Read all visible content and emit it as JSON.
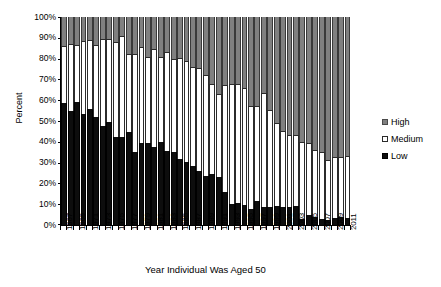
{
  "chart_data": {
    "type": "bar",
    "subtype": "stacked-100-percent-column",
    "title": "",
    "xlabel": "Year Individual Was Aged 50",
    "ylabel": "Percent",
    "ylim": [
      0,
      100
    ],
    "ytick_labels": [
      "100%",
      "90%",
      "80%",
      "70%",
      "60%",
      "50%",
      "40%",
      "30%",
      "20%",
      "10%",
      "0%"
    ],
    "ytick_values": [
      100,
      90,
      80,
      70,
      60,
      50,
      40,
      30,
      20,
      10,
      0
    ],
    "grid": false,
    "legend_position": "right",
    "stack_order_bottom_to_top": [
      "Low",
      "Medium",
      "High"
    ],
    "categories": [
      "1967",
      "1968",
      "1969",
      "1970",
      "1971",
      "1972",
      "1973",
      "1974",
      "1975",
      "1976",
      "1977",
      "1978",
      "1979",
      "1980",
      "1981",
      "1982",
      "1983",
      "1984",
      "1985",
      "1986",
      "1987",
      "1988",
      "1989",
      "1990",
      "1991",
      "1992",
      "1993",
      "1994",
      "1995",
      "1996",
      "1997",
      "1998",
      "1999",
      "2000",
      "2001",
      "2002",
      "2003",
      "2004",
      "2005",
      "2006",
      "2007",
      "2008",
      "2009",
      "2010",
      "2011"
    ],
    "xtick_labels_shown": [
      "1967",
      "1969",
      "1971",
      "1973",
      "1975",
      "1977",
      "1979",
      "1981",
      "1983",
      "1985",
      "1987",
      "1989",
      "1991",
      "1993",
      "1995",
      "1997",
      "1999",
      "2001",
      "2003",
      "2005",
      "2007",
      "2009",
      "2011"
    ],
    "series": [
      {
        "name": "Low",
        "color": "#0d0d0d",
        "values": [
          58.5,
          55.0,
          59.0,
          53.5,
          56.0,
          52.0,
          47.5,
          49.5,
          42.5,
          42.5,
          44.5,
          35.0,
          39.5,
          39.5,
          37.5,
          40.0,
          35.5,
          35.0,
          31.5,
          30.5,
          28.5,
          26.0,
          23.5,
          24.5,
          23.0,
          16.0,
          10.0,
          10.5,
          9.5,
          7.5,
          11.5,
          8.5,
          8.5,
          9.0,
          8.5,
          8.5,
          9.0,
          3.0,
          5.0,
          4.0,
          3.0,
          2.5,
          3.5,
          4.0,
          3.5
        ]
      },
      {
        "name": "Medium",
        "color": "#ffffff",
        "values": [
          27.5,
          32.0,
          27.5,
          35.0,
          33.0,
          34.5,
          42.0,
          40.0,
          45.5,
          48.5,
          37.5,
          47.0,
          46.0,
          41.5,
          47.0,
          41.0,
          47.5,
          45.0,
          49.0,
          48.5,
          47.5,
          49.5,
          48.5,
          43.5,
          40.0,
          51.5,
          58.0,
          57.5,
          56.5,
          49.5,
          45.5,
          55.0,
          47.0,
          40.0,
          36.5,
          35.0,
          34.5,
          37.0,
          34.5,
          32.0,
          32.0,
          29.0,
          29.0,
          28.5,
          29.5
        ]
      },
      {
        "name": "High",
        "color": "#808080",
        "values": [
          14.0,
          13.0,
          13.5,
          11.5,
          11.0,
          13.5,
          10.5,
          10.5,
          12.0,
          9.0,
          18.0,
          18.0,
          14.5,
          19.0,
          15.5,
          19.0,
          17.0,
          20.0,
          19.5,
          21.0,
          24.0,
          24.5,
          28.0,
          32.0,
          37.0,
          32.5,
          32.0,
          32.0,
          34.0,
          43.0,
          43.0,
          36.5,
          44.5,
          51.0,
          55.0,
          56.5,
          56.5,
          60.0,
          60.5,
          64.0,
          65.0,
          68.5,
          67.5,
          67.5,
          67.0
        ]
      }
    ]
  },
  "legend": {
    "items": [
      {
        "label": "High",
        "swatch": "high-swatch"
      },
      {
        "label": "Medium",
        "swatch": "medium-swatch"
      },
      {
        "label": "Low",
        "swatch": "low-swatch"
      }
    ]
  }
}
